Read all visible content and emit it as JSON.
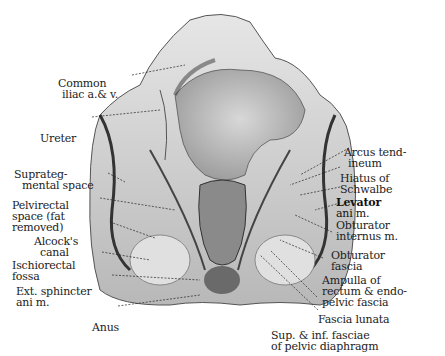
{
  "figure": {
    "labels_left": [
      {
        "id": "common-iliac",
        "lines": [
          "Common",
          "iliac a.& v."
        ]
      },
      {
        "id": "ureter",
        "lines": [
          "Ureter"
        ]
      },
      {
        "id": "supralevator-space",
        "lines": [
          "Suprateg-",
          "mental space"
        ]
      },
      {
        "id": "pelvirectal-space",
        "lines": [
          "Pelvirectal",
          "space (fat",
          "removed)"
        ]
      },
      {
        "id": "alcocks-canal",
        "lines": [
          "Alcock's",
          "canal"
        ]
      },
      {
        "id": "ischiorectal-fossa",
        "lines": [
          "Ischiorectal",
          "fossa"
        ]
      },
      {
        "id": "ext-sphincter",
        "lines": [
          "Ext. sphincter",
          "ani m."
        ]
      },
      {
        "id": "anus",
        "lines": [
          "Anus"
        ]
      }
    ],
    "labels_right": [
      {
        "id": "arcus-tendineum",
        "lines": [
          "Arcus tend-",
          "ineum"
        ]
      },
      {
        "id": "hiatus-schwalbe",
        "lines": [
          "Hiatus of",
          "Schwalbe"
        ]
      },
      {
        "id": "levator-ani",
        "lines": [
          "Levator",
          "ani m."
        ]
      },
      {
        "id": "obturator-internus",
        "lines": [
          "Obturator",
          "internus m."
        ]
      },
      {
        "id": "obturator-fascia",
        "lines": [
          "Obturator",
          "fascia"
        ]
      },
      {
        "id": "ampulla-rectum",
        "lines": [
          "Ampulla of",
          "rectum & endo-",
          "pelvic fascia"
        ]
      },
      {
        "id": "fascia-lunata",
        "lines": [
          "Fascia lunata"
        ]
      },
      {
        "id": "sup-inf-fasciae",
        "lines": [
          "Sup. & inf. fasciae",
          "of pelvic diaphragm"
        ]
      }
    ]
  }
}
